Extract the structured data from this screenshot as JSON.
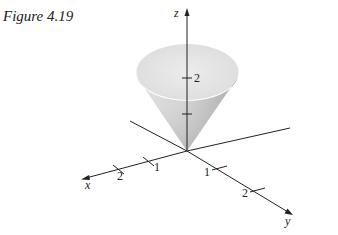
{
  "figure": {
    "caption": "Figure 4.19"
  },
  "axes": {
    "x": {
      "label": "x",
      "ticks": [
        "1",
        "2"
      ]
    },
    "y": {
      "label": "y",
      "ticks": [
        "1",
        "2"
      ]
    },
    "z": {
      "label": "z",
      "ticks": [
        "2"
      ]
    }
  },
  "colors": {
    "cone_fill_light": "#ececec",
    "cone_fill_dark": "#9a9a9a",
    "axis": "#222222",
    "background": "#ffffff"
  }
}
